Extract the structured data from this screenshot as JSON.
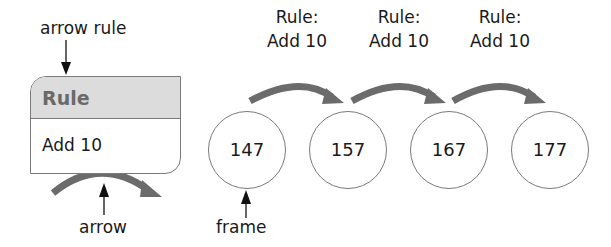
{
  "annotations": {
    "arrow_rule": "arrow rule",
    "arrow": "arrow",
    "frame": "frame"
  },
  "rule_box": {
    "header": "Rule",
    "body": "Add 10"
  },
  "frames": [
    {
      "value": "147"
    },
    {
      "value": "157"
    },
    {
      "value": "167"
    },
    {
      "value": "177"
    }
  ],
  "rule_labels": [
    {
      "line1": "Rule:",
      "line2": "Add 10"
    },
    {
      "line1": "Rule:",
      "line2": "Add 10"
    },
    {
      "line1": "Rule:",
      "line2": "Add 10"
    }
  ],
  "colors": {
    "arrow_fill": "#6b6b6b",
    "header_bg": "#dcdcdc",
    "border": "#7a7a7a"
  }
}
